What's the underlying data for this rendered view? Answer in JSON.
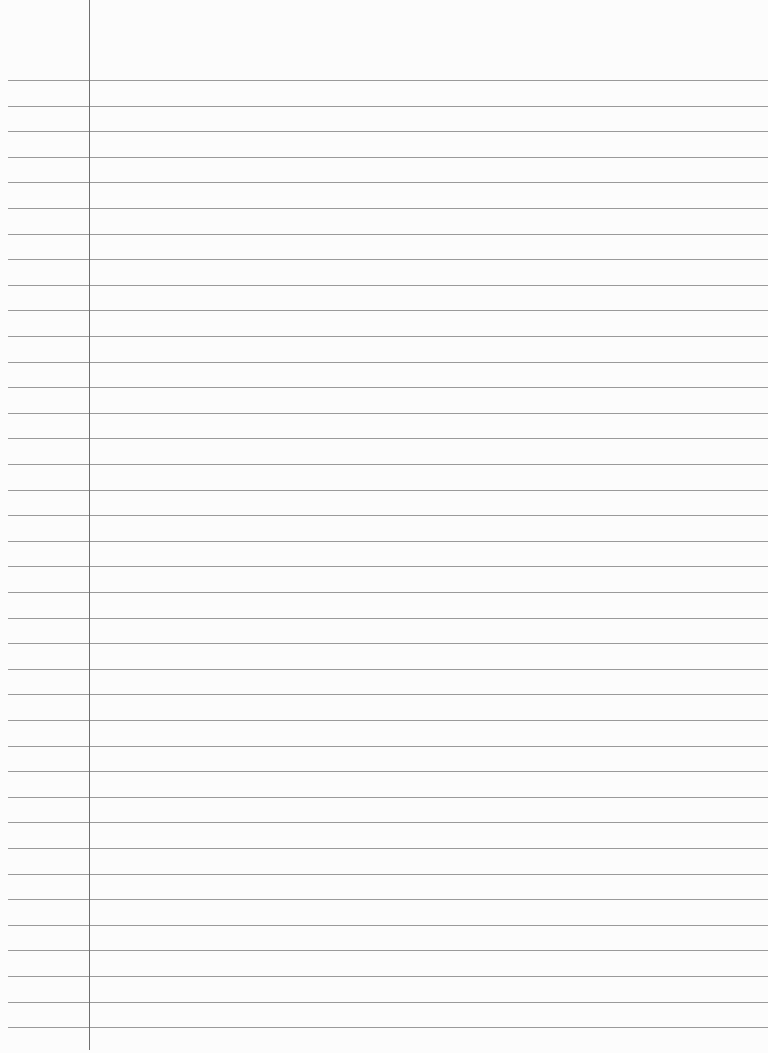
{
  "page": {
    "type": "ruled-notebook-paper",
    "background_color": "#fcfcfc",
    "rule_color": "#9a9a9a",
    "margin_line_color": "#6f6f6f",
    "margin_line_x": 89,
    "first_rule_y": 80,
    "rule_spacing": 25.6,
    "rule_count": 38,
    "text": ""
  }
}
